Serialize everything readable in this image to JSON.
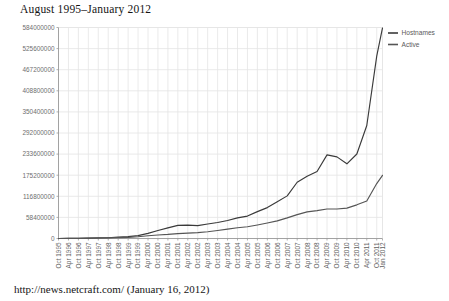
{
  "figure": {
    "title": "August 1995–January 2012",
    "caption": "http://news.netcraft.com/ (January 16, 2012)"
  },
  "legend": {
    "position": "top-right",
    "entries": [
      {
        "label": "Hostnames",
        "color": "#3a3a3a"
      },
      {
        "label": "Active",
        "color": "#555555"
      }
    ]
  },
  "colors": {
    "hostnames_line": "#3a3a3a",
    "active_line": "#555555",
    "grid": "#e4e4e4",
    "axis": "#9a9a9a",
    "tick_text": "#6e6e6e",
    "title_text": "#141414",
    "background": "#ffffff"
  },
  "chart_data": {
    "type": "line",
    "title": "August 1995–January 2012",
    "subtitle": "",
    "xlabel": "",
    "ylabel": "",
    "grid": true,
    "legend_position": "top-right",
    "ylim": [
      0,
      584000000
    ],
    "ytick_labels": [
      "584000000",
      "525600000",
      "467200000",
      "408800000",
      "350400000",
      "292000000",
      "233600000",
      "175200000",
      "116800000",
      "58400000",
      "0"
    ],
    "ytick_values": [
      584000000,
      525600000,
      467200000,
      408800000,
      350400000,
      292000000,
      233600000,
      175200000,
      116800000,
      58400000,
      0
    ],
    "xtick_labels": [
      "Oct 1995",
      "Apr 1996",
      "Oct 1996",
      "Apr 1997",
      "Oct 1997",
      "Apr 1998",
      "Oct 1998",
      "Apr 1999",
      "Oct 1999",
      "Apr 2000",
      "Oct 2000",
      "Apr 2001",
      "Oct 2001",
      "Apr 2002",
      "Oct 2002",
      "Apr 2003",
      "Oct 2003",
      "Apr 2004",
      "Oct 2004",
      "Apr 2005",
      "Oct 2005",
      "Apr 2006",
      "Oct 2006",
      "Apr 2007",
      "Oct 2007",
      "Apr 2008",
      "Oct 2008",
      "Apr 2009",
      "Oct 2009",
      "Apr 2010",
      "Oct 2010",
      "Apr 2011",
      "Oct 2011",
      "Jan 2012"
    ],
    "x": [
      1995.75,
      1996.25,
      1996.75,
      1997.25,
      1997.75,
      1998.25,
      1998.75,
      1999.25,
      1999.75,
      2000.25,
      2000.75,
      2001.25,
      2001.75,
      2002.25,
      2002.75,
      2003.25,
      2003.75,
      2004.25,
      2004.75,
      2005.25,
      2005.75,
      2006.25,
      2006.75,
      2007.25,
      2007.75,
      2008.25,
      2008.75,
      2009.25,
      2009.75,
      2010.25,
      2010.75,
      2011.25,
      2011.75,
      2012.04
    ],
    "series": [
      {
        "name": "Hostnames",
        "color": "#3a3a3a",
        "values": [
          120000,
          250000,
          600000,
          1200000,
          1700000,
          2200000,
          3700000,
          5100000,
          8100000,
          14300000,
          22300000,
          29300000,
          36300000,
          37200000,
          35700000,
          40200000,
          44200000,
          49800000,
          57000000,
          62000000,
          74400000,
          85500000,
          101400000,
          118000000,
          155600000,
          172300000,
          185500000,
          231500000,
          226000000,
          206700000,
          233800000,
          312700000,
          504600000,
          582700000
        ]
      },
      {
        "name": "Active",
        "color": "#555555",
        "values": [
          80000,
          180000,
          420000,
          850000,
          1250000,
          1650000,
          2600000,
          3300000,
          4800000,
          7500000,
          9700000,
          11300000,
          13600000,
          14700000,
          16100000,
          18600000,
          22100000,
          26000000,
          29900000,
          32600000,
          37500000,
          42900000,
          48900000,
          57100000,
          66200000,
          73700000,
          77100000,
          81800000,
          81500000,
          84100000,
          93200000,
          104000000,
          152000000,
          174800000
        ]
      }
    ]
  },
  "axes": {
    "y_title": "",
    "x_title": ""
  }
}
